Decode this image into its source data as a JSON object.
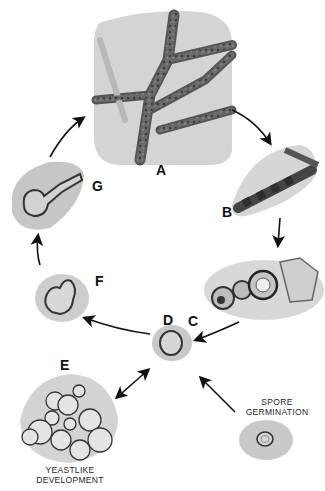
{
  "figure": {
    "stages": [
      {
        "id": "A",
        "label": "A",
        "description": "branching septate hyphae"
      },
      {
        "id": "B",
        "label": "B",
        "description": "segmented hypha forming arthroconidia"
      },
      {
        "id": "C",
        "label": "C",
        "description": "chain of enlarged rounded cells"
      },
      {
        "id": "D",
        "label": "D",
        "description": "single spherical cell"
      },
      {
        "id": "E",
        "label": "E",
        "description": "cluster of yeast cells"
      },
      {
        "id": "F",
        "label": "F",
        "description": "budding cell"
      },
      {
        "id": "G",
        "label": "G",
        "description": "germ tube elongating"
      }
    ],
    "captions": {
      "yeastlike": [
        "YEASTLIKE",
        "DEVELOPMENT"
      ],
      "spore": [
        "SPORE",
        "GERMINATION"
      ]
    },
    "colors": {
      "background": "#ffffff",
      "panel": "#cfcfcf",
      "panel_light": "#dedede",
      "hypha": "#5a5a5a",
      "ink": "#111111"
    }
  }
}
